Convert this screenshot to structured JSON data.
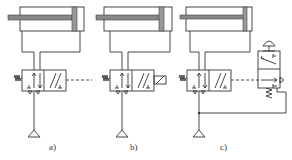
{
  "diagram": {
    "type": "pneumatic circuit schematics",
    "subfigures": [
      {
        "id": "a",
        "label": "a)",
        "cylinder": "single-rod double-acting",
        "valve": "4/2 valve, spring return, dashed pilot to right",
        "actuation": "remote pilot (dashed line)"
      },
      {
        "id": "b",
        "label": "b)",
        "cylinder": "single-rod double-acting",
        "valve": "4/2 valve, spring return",
        "actuation": "solenoid"
      },
      {
        "id": "c",
        "label": "c)",
        "cylinder": "single-rod double-acting",
        "valve": "4/2 valve, spring return, pilot from 3/2 push-button valve",
        "actuation": "push-button 3/2 valve with spring return"
      }
    ],
    "symbols": {
      "pressure_source": "triangle",
      "spring": "zigzag",
      "exhaust": "T-mark"
    }
  }
}
